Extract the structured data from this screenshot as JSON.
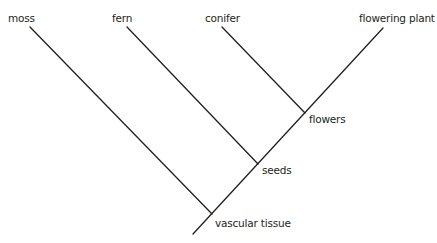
{
  "diagram": {
    "type": "cladogram",
    "line_color": "#231f20",
    "taxa": [
      {
        "id": "moss",
        "label": "moss"
      },
      {
        "id": "fern",
        "label": "fern"
      },
      {
        "id": "conifer",
        "label": "conifer"
      },
      {
        "id": "flowering",
        "label": "flowering plant"
      }
    ],
    "traits": [
      {
        "id": "vascular",
        "label": "vascular tissue"
      },
      {
        "id": "seeds",
        "label": "seeds"
      },
      {
        "id": "flowers",
        "label": "flowers"
      }
    ]
  }
}
